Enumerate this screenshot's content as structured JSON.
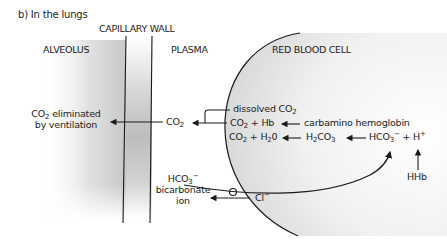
{
  "figure": {
    "title": "b) In the lungs",
    "regions": {
      "capillary_wall": "CAPILLARY WALL",
      "alveolus": "ALVEOLUS",
      "plasma": "PLASMA",
      "red_blood_cell": "RED BLOOD CELL"
    },
    "labels": {
      "co2_eliminated_line1_co": "CO",
      "co2_eliminated_line1_sub": "2",
      "co2_eliminated_line1_rest": " eliminated",
      "co2_eliminated_line2": "by ventilation",
      "plasma_co2": "CO",
      "plasma_co2_sub": "2",
      "dissolved": "dissolved CO",
      "dissolved_sub": "2",
      "co2_hb_a": "CO",
      "co2_hb_sub": "2",
      "co2_hb_b": " + Hb",
      "carbamino": "carbamino hemoglobin",
      "co2_h2o_a": "CO",
      "co2_h2o_sub1": "2",
      "co2_h2o_b": " + H",
      "co2_h2o_sub2": "2",
      "co2_h2o_c": "0",
      "h2co3_a": "H",
      "h2co3_sub1": "2",
      "h2co3_b": "CO",
      "h2co3_sub2": "3",
      "hco3_h_a": "HCO",
      "hco3_h_sub": "3",
      "hco3_h_sup1": "−",
      "hco3_h_b": " + H",
      "hco3_h_sup2": "+",
      "hhb": "HHb",
      "bicarb_line1_a": "HCO",
      "bicarb_line1_sub": "3",
      "bicarb_line1_sup": "−",
      "bicarb_line2": "bicarbonate",
      "bicarb_line3": "ion",
      "chloride": "Cl",
      "chloride_sup": "−"
    },
    "colors": {
      "line": "#1a1a1a",
      "shade_dark": "#bdbdbd",
      "shade_cell": "#e6e6e6",
      "text": "#222222"
    }
  }
}
